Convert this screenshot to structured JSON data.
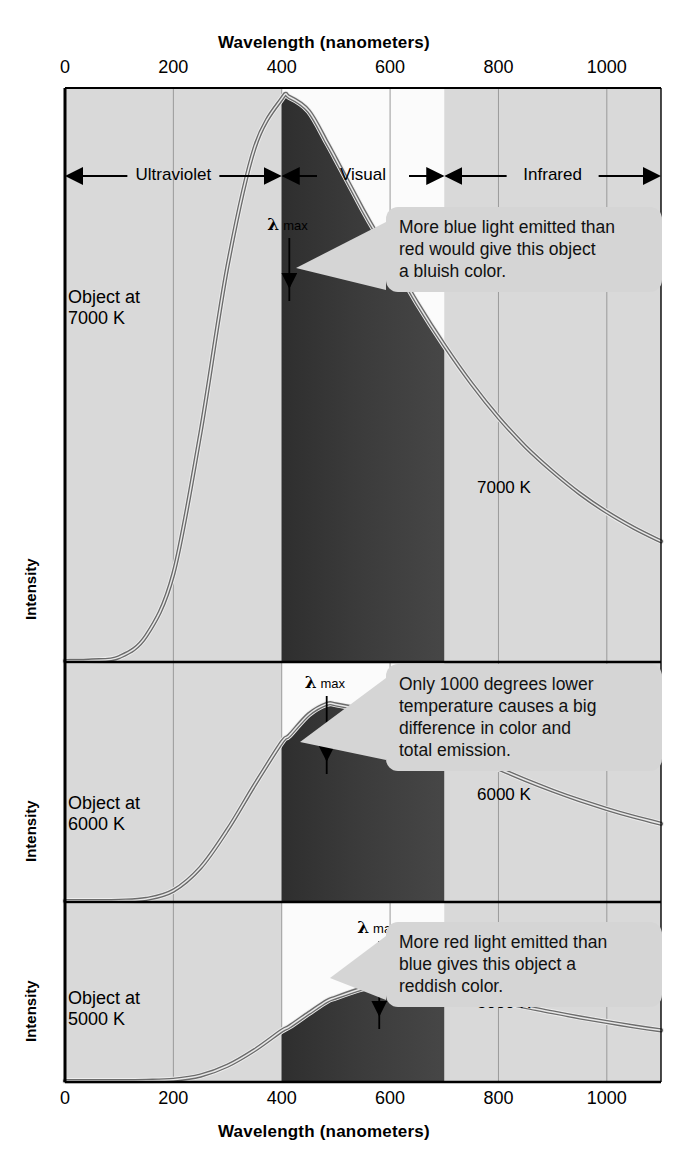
{
  "figure": {
    "top_axis_title": "Wavelength (nanometers)",
    "bottom_axis_title": "Wavelength (nanometers)",
    "y_axis_label": "Intensity",
    "tick_labels": [
      "0",
      "200",
      "400",
      "600",
      "800",
      "1000"
    ],
    "tick_values": [
      0,
      200,
      400,
      600,
      800,
      1000
    ],
    "regions": [
      {
        "name": "ultraviolet",
        "label": "Ultraviolet",
        "from": 0,
        "to": 400
      },
      {
        "name": "visual",
        "label": "Visual",
        "from": 400,
        "to": 700
      },
      {
        "name": "infrared",
        "label": "Infrared",
        "from": 700,
        "to": 1100
      }
    ],
    "lambda_max_label": {
      "symbol": "λ",
      "subscript": "max"
    },
    "colors": {
      "panel_background": "#d9d9d9",
      "visual_band_background": "#fbfbfb",
      "curve_stroke": "#6b6b6b",
      "curve_core": "#3a3a3a",
      "callout_background": "#d5d5d5",
      "axis": "#000000",
      "gridline": "#9a9a9a",
      "fill_dark": "#2a2a2a"
    }
  },
  "panels": [
    {
      "name": "panel-7000k",
      "object_label": "Object at\n7000 K",
      "curve_label": "7000 K",
      "temperature_k": 7000,
      "lambda_max_nm": 414,
      "callout": "More blue light emitted than\nred would give this object\na bluish color."
    },
    {
      "name": "panel-6000k",
      "object_label": "Object at\n6000 K",
      "curve_label": "6000 K",
      "temperature_k": 6000,
      "lambda_max_nm": 483,
      "callout": "Only 1000 degrees lower\ntemperature causes a big\ndifference in color and\ntotal emission."
    },
    {
      "name": "panel-5000k",
      "object_label": "Object at\n5000 K",
      "curve_label": "5000 K",
      "temperature_k": 5000,
      "lambda_max_nm": 580,
      "callout": "More red light emitted than\nblue gives this object a\nreddish color."
    }
  ],
  "chart_data": {
    "type": "line",
    "xlabel": "Wavelength (nanometers)",
    "ylabel": "Intensity",
    "xlim": [
      0,
      1100
    ],
    "ylim": [
      0,
      1.05
    ],
    "grid": true,
    "legend_position": "inline-labels",
    "x_ticks": [
      0,
      200,
      400,
      600,
      800,
      1000
    ],
    "y_ticks": [],
    "shaded_regions": [
      {
        "label": "Ultraviolet",
        "range_nm": [
          0,
          400
        ],
        "shade": "gray"
      },
      {
        "label": "Visual",
        "range_nm": [
          400,
          700
        ],
        "shade": "white"
      },
      {
        "label": "Infrared",
        "range_nm": [
          700,
          1100
        ],
        "shade": "gray"
      }
    ],
    "annotations": [
      {
        "text": "λ max",
        "panel": "7000 K",
        "at_nm": 414
      },
      {
        "text": "λ max",
        "panel": "6000 K",
        "at_nm": 483
      },
      {
        "text": "λ max",
        "panel": "5000 K",
        "at_nm": 580
      },
      {
        "text": "More blue light emitted than red would give this object a bluish color.",
        "panel": "7000 K"
      },
      {
        "text": "Only 1000 degrees lower temperature causes a big difference in color and total emission.",
        "panel": "6000 K"
      },
      {
        "text": "More red light emitted than blue gives this object a reddish color.",
        "panel": "5000 K"
      }
    ],
    "x": [
      50,
      100,
      150,
      200,
      250,
      300,
      350,
      400,
      414,
      450,
      483,
      500,
      550,
      580,
      600,
      650,
      700,
      750,
      800,
      850,
      900,
      950,
      1000,
      1050,
      1100
    ],
    "series": [
      {
        "name": "7000 K",
        "peak_nm": 414,
        "panel_relative_values": [
          0.001,
          0.007,
          0.045,
          0.155,
          0.405,
          0.7,
          0.91,
          0.997,
          1.0,
          0.975,
          0.92,
          0.89,
          0.8,
          0.75,
          0.718,
          0.635,
          0.56,
          0.492,
          0.432,
          0.38,
          0.336,
          0.297,
          0.264,
          0.236,
          0.212
        ]
      },
      {
        "name": "6000 K",
        "peak_nm": 483,
        "panel_relative_values": [
          0.0,
          0.001,
          0.009,
          0.045,
          0.145,
          0.31,
          0.505,
          0.69,
          0.72,
          0.812,
          0.857,
          0.855,
          0.83,
          0.808,
          0.792,
          0.742,
          0.686,
          0.63,
          0.576,
          0.526,
          0.48,
          0.438,
          0.4,
          0.366,
          0.336
        ]
      },
      {
        "name": "5000 K",
        "peak_nm": 580,
        "panel_relative_values": [
          0.0,
          0.0,
          0.001,
          0.007,
          0.032,
          0.09,
          0.182,
          0.296,
          0.32,
          0.4,
          0.47,
          0.492,
          0.545,
          0.56,
          0.562,
          0.552,
          0.53,
          0.5,
          0.468,
          0.436,
          0.404,
          0.374,
          0.347,
          0.321,
          0.298
        ]
      }
    ]
  }
}
